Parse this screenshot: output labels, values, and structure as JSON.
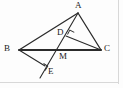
{
  "figure": {
    "kind": "geometry-diagram",
    "width": 123,
    "height": 88,
    "background_color": "#fdfdfd",
    "stroke_color": "#2b2b2b",
    "label_color": "#1a1a1a",
    "frame_color": "#d8d8d8"
  },
  "points": {
    "A": {
      "label": "A",
      "x": 78,
      "y": 13,
      "label_x": 75,
      "label_y": 2
    },
    "B": {
      "label": "B",
      "x": 19,
      "y": 50,
      "label_x": 4,
      "label_y": 45
    },
    "C": {
      "label": "C",
      "x": 101,
      "y": 50,
      "label_x": 104,
      "label_y": 45
    },
    "D": {
      "label": "D",
      "x": 66,
      "y": 36,
      "label_x": 57,
      "label_y": 29
    },
    "M": {
      "label": "M",
      "x": 57,
      "y": 50,
      "label_x": 59,
      "label_y": 52
    },
    "E": {
      "label": "E",
      "x": 45,
      "y": 66,
      "label_x": 48,
      "label_y": 67
    },
    "F": {
      "label": "",
      "x": 40,
      "y": 78,
      "label_x": 0,
      "label_y": 0
    }
  },
  "segments": [
    {
      "name": "segment-BA",
      "from": "B",
      "to": "A",
      "width": 1.3
    },
    {
      "name": "segment-AC",
      "from": "A",
      "to": "C",
      "width": 1.3
    },
    {
      "name": "segment-BC",
      "from": "B",
      "to": "C",
      "width": 1.8
    },
    {
      "name": "segment-A-to-F",
      "from": "A",
      "to": "F",
      "width": 1.1
    },
    {
      "name": "segment-DC",
      "from": "D",
      "to": "C",
      "width": 1.1
    },
    {
      "name": "segment-BE",
      "from": "B",
      "to": "E",
      "width": 1.1
    }
  ],
  "right_angle_marks": [
    {
      "name": "right-angle-at-D",
      "vertex": "D",
      "size": 5,
      "rotation": -62
    },
    {
      "name": "right-angle-at-E",
      "vertex": "E",
      "size": 5,
      "rotation": 118
    }
  ],
  "labels_order": [
    "A",
    "B",
    "C",
    "D",
    "M",
    "E"
  ]
}
